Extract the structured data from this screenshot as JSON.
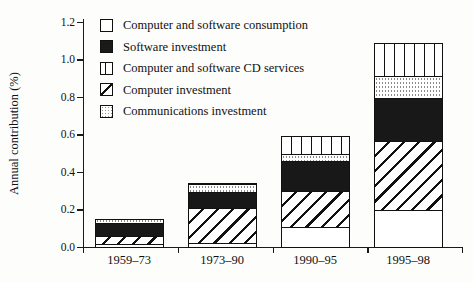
{
  "figure": {
    "ylabel": "Annual contribution (%)",
    "ytick_labels": [
      "0.0",
      "0.2",
      "0.4",
      "0.6",
      "0.8",
      "1.0",
      "1.2"
    ],
    "xtick_labels": [
      "1959–73",
      "1973–90",
      "1990–95",
      "1995–98"
    ]
  },
  "legend": {
    "items": [
      {
        "label": "Computer and software consumption",
        "pattern": "white"
      },
      {
        "label": "Software investment",
        "pattern": "black"
      },
      {
        "label": "Computer and software CD services",
        "pattern": "vertical-stripes"
      },
      {
        "label": "Computer investment",
        "pattern": "diagonal-hatch"
      },
      {
        "label": "Communications investment",
        "pattern": "dotted"
      }
    ]
  },
  "chart_data": {
    "type": "bar",
    "stacked": true,
    "title": "",
    "xlabel": "",
    "ylabel": "Annual contribution (%)",
    "ylim": [
      0,
      1.2
    ],
    "yticks": [
      0.0,
      0.2,
      0.4,
      0.6,
      0.8,
      1.0,
      1.2
    ],
    "grid": false,
    "legend_position": "upper-left-inside",
    "categories": [
      "1959–73",
      "1973–90",
      "1990–95",
      "1995–98"
    ],
    "stack_order": "bottom-to-top",
    "series": [
      {
        "name": "Computer and software consumption",
        "pattern": "white",
        "values": [
          0.01,
          0.015,
          0.1,
          0.19
        ]
      },
      {
        "name": "Computer investment",
        "pattern": "diagonal-hatch",
        "values": [
          0.045,
          0.185,
          0.195,
          0.37
        ]
      },
      {
        "name": "Software investment",
        "pattern": "black",
        "values": [
          0.07,
          0.09,
          0.16,
          0.23
        ]
      },
      {
        "name": "Communications investment",
        "pattern": "dotted",
        "values": [
          0.025,
          0.04,
          0.035,
          0.115
        ]
      },
      {
        "name": "Computer and software CD services",
        "pattern": "vertical-stripes",
        "values": [
          0.0,
          0.01,
          0.1,
          0.18
        ]
      }
    ],
    "totals": [
      0.15,
      0.34,
      0.59,
      1.085
    ]
  }
}
